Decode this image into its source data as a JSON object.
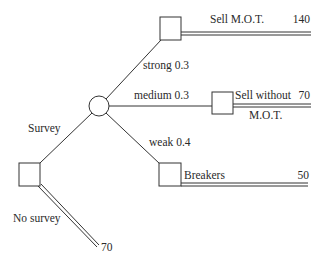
{
  "diagram": {
    "type": "decision-tree",
    "colors": {
      "line": "#333333",
      "text": "#2a2a2a",
      "background": "#ffffff"
    },
    "nodes": {
      "root": {
        "type": "decision",
        "shape": "square"
      },
      "survey_chance": {
        "type": "chance",
        "shape": "circle"
      },
      "strong_decision": {
        "type": "decision",
        "shape": "square"
      },
      "medium_decision": {
        "type": "decision",
        "shape": "square"
      },
      "weak_decision": {
        "type": "decision",
        "shape": "square"
      }
    },
    "branches": {
      "survey": {
        "label": "Survey"
      },
      "no_survey": {
        "label": "No survey",
        "payoff": "70"
      },
      "strong": {
        "label": "strong 0.3"
      },
      "medium": {
        "label": "medium 0.3"
      },
      "weak": {
        "label": "weak 0.4"
      },
      "sell_mot": {
        "label": "Sell M.O.T.",
        "payoff": "140"
      },
      "sell_without_mot": {
        "label_line1": "Sell without",
        "label_line2": "M.O.T.",
        "payoff": "70"
      },
      "breakers": {
        "label": "Breakers",
        "payoff": "50"
      }
    }
  }
}
